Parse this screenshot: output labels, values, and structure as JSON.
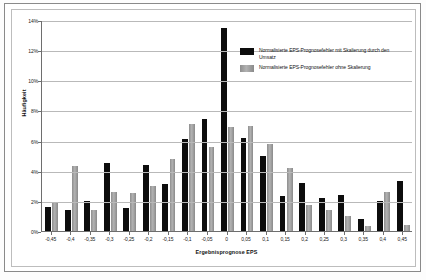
{
  "figure": {
    "ylabel": "Häufigkeit",
    "xlabel": "Ergebnisprognose EPS"
  },
  "legend": {
    "entries": [
      {
        "label": "Normalisierte EPS-Prognosefehler mit Skalierung durch den Umsatz",
        "color": "#0d0d0d",
        "key": "s0"
      },
      {
        "label": "Normalisierte EPS-Prognosefehler ohne Skalierung",
        "color": "#9c9c9c",
        "key": "s1"
      }
    ]
  },
  "chart_data": {
    "type": "bar",
    "title": "",
    "xlabel": "Ergebnisprognose EPS",
    "ylabel": "Häufigkeit",
    "ylim": [
      0,
      14
    ],
    "yticks": [
      "0%",
      "2%",
      "4%",
      "6%",
      "8%",
      "10%",
      "12%",
      "14%"
    ],
    "ytick_values": [
      0,
      2,
      4,
      6,
      8,
      10,
      12,
      14
    ],
    "grid": true,
    "legend_position": "upper-right-inside",
    "categories": [
      "-0,45",
      "-0,4",
      "-0,35",
      "-0,3",
      "-0,25",
      "-0,2",
      "-0,15",
      "-0,1",
      "-0,05",
      "0",
      "0,05",
      "0,1",
      "0,15",
      "0,2",
      "0,25",
      "0,3",
      "0,35",
      "0,4",
      "0,45"
    ],
    "series": [
      {
        "name": "Normalisierte EPS-Prognosefehler mit Skalierung durch den Umsatz",
        "color": "#0d0d0d",
        "values": [
          1.6,
          1.4,
          2.0,
          4.5,
          1.5,
          4.4,
          3.1,
          6.1,
          7.4,
          13.5,
          6.2,
          5.0,
          2.3,
          3.2,
          2.2,
          2.4,
          0.8,
          2.0,
          3.3
        ]
      },
      {
        "name": "Normalisierte EPS-Prognosefehler ohne Skalierung",
        "color": "#9c9c9c",
        "values": [
          1.9,
          4.3,
          1.4,
          2.6,
          2.5,
          3.0,
          4.8,
          7.1,
          5.6,
          6.9,
          7.0,
          5.8,
          4.2,
          1.7,
          1.4,
          1.0,
          0.3,
          2.6,
          0.4
        ]
      }
    ]
  }
}
